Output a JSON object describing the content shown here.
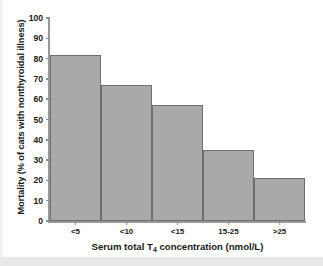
{
  "chart_data": {
    "type": "bar",
    "title": "",
    "subtitle": "",
    "categories": [
      "<5",
      "<10",
      "<15",
      "15-25",
      ">25"
    ],
    "values": [
      82,
      67,
      57,
      35,
      21
    ],
    "series": [
      {
        "name": "Mortality",
        "values": [
          82,
          67,
          57,
          35,
          21
        ]
      }
    ],
    "xlabel_parts": {
      "before": "Serum total T",
      "subscript": "4",
      "after": " concentration (nmol/L)"
    },
    "xlabel": "Serum total T4 concentration (nmol/L)",
    "ylabel": "Mortality (% of cats with nonthyroidal illness)",
    "ylim": [
      0,
      100
    ],
    "ytick_values": [
      0,
      10,
      20,
      30,
      40,
      50,
      60,
      70,
      80,
      90,
      100
    ],
    "ytick_labels": [
      "0",
      "10",
      "20",
      "30",
      "40",
      "50",
      "60",
      "70",
      "80",
      "90",
      "100"
    ],
    "grid": false,
    "legend": false,
    "legend_position": "none",
    "bar_gap": 0,
    "colors": {
      "bar_fill": "#a9a9a9",
      "bar_edge": "#6e6e6e",
      "axis": "#999999",
      "text": "#1a1a1a",
      "background": "#ffffff"
    }
  }
}
